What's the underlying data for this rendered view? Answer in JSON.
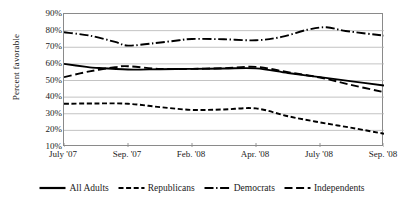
{
  "chart_data": {
    "type": "line",
    "title": "",
    "xlabel": "",
    "ylabel": "Percent favorable",
    "categories": [
      "July '07",
      "Sep. '07",
      "Feb. '08",
      "Apr. '08",
      "July '08",
      "Sep. '08"
    ],
    "xtick_labels": [
      "July '07",
      "Sep. '07",
      "Feb. '08",
      "Apr. '08",
      "July '08",
      "Sep. '08"
    ],
    "ytick_labels": [
      "90%",
      "80%",
      "70%",
      "60%",
      "50%",
      "40%",
      "30%",
      "20%",
      "10%"
    ],
    "ytick_values": [
      90,
      80,
      70,
      60,
      50,
      40,
      30,
      20,
      10
    ],
    "ylim": [
      10,
      90
    ],
    "grid": true,
    "grid_axis": "y",
    "legend_position": "bottom",
    "series": [
      {
        "name": "All Adults",
        "style": "solid",
        "color": "#000000",
        "x": [
          "July '07",
          "Sep. '07",
          "Feb. '08",
          "Apr. '08",
          "July '08",
          "Sep. '08"
        ],
        "values": [
          60,
          57,
          57,
          57,
          52,
          47
        ],
        "dense_x": [
          0,
          0.35,
          0.5,
          1,
          1.5,
          2,
          2.5,
          3,
          3.5,
          4,
          4.5,
          5
        ],
        "dense_values": [
          60,
          58.2,
          57.6,
          56.6,
          56.8,
          57.0,
          57.2,
          57.3,
          54.5,
          52.0,
          49.5,
          47.0
        ]
      },
      {
        "name": "Republicans",
        "style": "dashed",
        "color": "#000000",
        "x": [
          "July '07",
          "Sep. '07",
          "Feb. '08",
          "Apr. '08",
          "July '08",
          "Sep. '08"
        ],
        "values": [
          36,
          36,
          32,
          33,
          25,
          18
        ],
        "dense_x": [
          0,
          0.5,
          1,
          1.5,
          2,
          2.5,
          3,
          3.5,
          4,
          4.5,
          5
        ],
        "dense_values": [
          36,
          36.2,
          36,
          34,
          32.3,
          32.6,
          33.2,
          28.5,
          24.8,
          21.5,
          18.0
        ]
      },
      {
        "name": "Democrats",
        "style": "dashdot",
        "color": "#000000",
        "x": [
          "July '07",
          "Sep. '07",
          "Feb. '08",
          "Apr. '08",
          "July '08",
          "Sep. '08"
        ],
        "values": [
          79,
          71,
          75,
          74,
          82,
          77
        ],
        "dense_x": [
          0,
          0.4,
          0.8,
          1,
          1.4,
          1.8,
          2,
          2.5,
          3,
          3.4,
          3.8,
          4.1,
          4.4,
          5
        ],
        "dense_values": [
          79,
          77,
          73.2,
          71.0,
          72.4,
          74.2,
          75.0,
          74.8,
          74.2,
          76.2,
          80.5,
          82.0,
          79.8,
          77.0
        ]
      },
      {
        "name": "Independents",
        "style": "longdash",
        "color": "#000000",
        "x": [
          "July '07",
          "Sep. '07",
          "Feb. '08",
          "Apr. '08",
          "July '08",
          "Sep. '08"
        ],
        "values": [
          52,
          58,
          57,
          58,
          52,
          43
        ],
        "dense_x": [
          0,
          0.4,
          0.8,
          1,
          1.5,
          2,
          2.5,
          3,
          3.5,
          4,
          4.5,
          5
        ],
        "dense_values": [
          52,
          55.5,
          58.0,
          58.6,
          57.0,
          57.0,
          57.4,
          58.2,
          55.0,
          51.8,
          47.2,
          43.0
        ]
      }
    ]
  },
  "legend": {
    "items": [
      {
        "label": "All Adults",
        "style": "solid"
      },
      {
        "label": "Republicans",
        "style": "dashed"
      },
      {
        "label": "Democrats",
        "style": "dashdot"
      },
      {
        "label": "Independents",
        "style": "longdash"
      }
    ]
  }
}
